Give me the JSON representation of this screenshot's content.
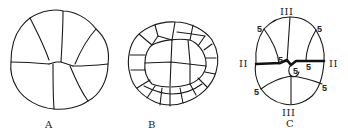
{
  "figure": {
    "panels": [
      {
        "id": "A",
        "label": "A",
        "description": "8-cell cleavage stage, side view"
      },
      {
        "id": "B",
        "label": "B",
        "description": "Multicellular cleavage stage with many cells"
      },
      {
        "id": "C",
        "label": "C",
        "description": "Cleavage stage with labeled division planes"
      }
    ],
    "panel_c_annotations": {
      "top": "III",
      "bottom": "III",
      "left": "II",
      "right": "II",
      "cell_numbers": [
        "5",
        "5",
        "5",
        "5",
        "5",
        "5",
        "5"
      ]
    }
  }
}
